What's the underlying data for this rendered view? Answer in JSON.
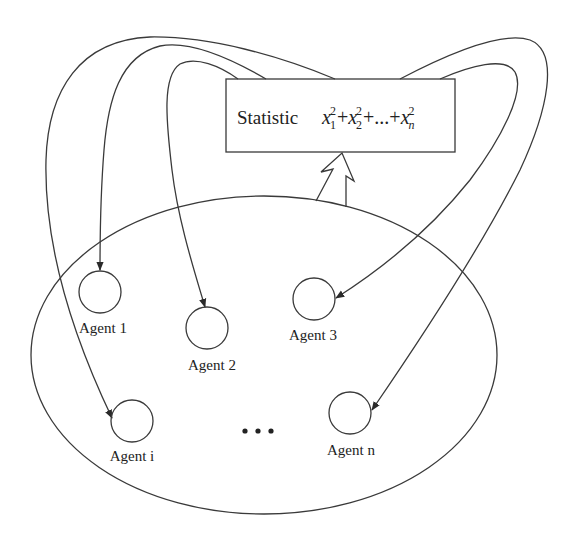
{
  "statistic_box": {
    "label": "Statistic",
    "formula": {
      "terms": [
        {
          "var": "x",
          "sub": "1",
          "sup": "2"
        },
        {
          "op": "+"
        },
        {
          "var": "x",
          "sub": "2",
          "sup": "2"
        },
        {
          "op": "+...+"
        },
        {
          "var": "x",
          "sub": "n",
          "sup": "2"
        }
      ],
      "plain": "x₁² + x₂² + ... + xₙ²"
    },
    "t1_var": "x",
    "t1_sub": "1",
    "t1_sup": "2",
    "op1": "+",
    "t2_var": "x",
    "t2_sub": "2",
    "t2_sup": "2",
    "op2": "+...+",
    "tn_var": "x",
    "tn_sub": "n",
    "tn_sup": "2"
  },
  "agents": [
    {
      "id": "agent-1",
      "label": "Agent 1"
    },
    {
      "id": "agent-2",
      "label": "Agent 2"
    },
    {
      "id": "agent-3",
      "label": "Agent 3"
    },
    {
      "id": "agent-i",
      "label": "Agent i"
    },
    {
      "id": "agent-n",
      "label": "Agent n"
    }
  ],
  "ellipsis": "•••",
  "edges": [
    {
      "from": "statistic",
      "to": "agent-1",
      "type": "feedback-arrow"
    },
    {
      "from": "statistic",
      "to": "agent-2",
      "type": "feedback-arrow"
    },
    {
      "from": "statistic",
      "to": "agent-3",
      "type": "feedback-arrow"
    },
    {
      "from": "statistic",
      "to": "agent-i",
      "type": "feedback-arrow"
    },
    {
      "from": "statistic",
      "to": "agent-n",
      "type": "feedback-arrow"
    },
    {
      "from": "agent-population",
      "to": "statistic",
      "type": "hollow-aggregate-arrow"
    }
  ],
  "colors": {
    "stroke": "#3a3a3a",
    "text": "#222222",
    "background": "#ffffff"
  }
}
